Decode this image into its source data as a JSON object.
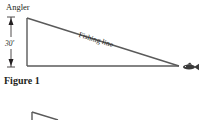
{
  "figure": {
    "caption": "Figure 1",
    "labels": {
      "top_vertex": "Angler",
      "height": "30′",
      "hypotenuse": "Fishing line"
    },
    "icons": {
      "end_point": "fish-icon",
      "dimension_marker": "double-arrow-icon"
    },
    "colors": {
      "stroke": "#5a5a5a",
      "text": "#231f20",
      "fish": "#3a3a3a"
    }
  }
}
